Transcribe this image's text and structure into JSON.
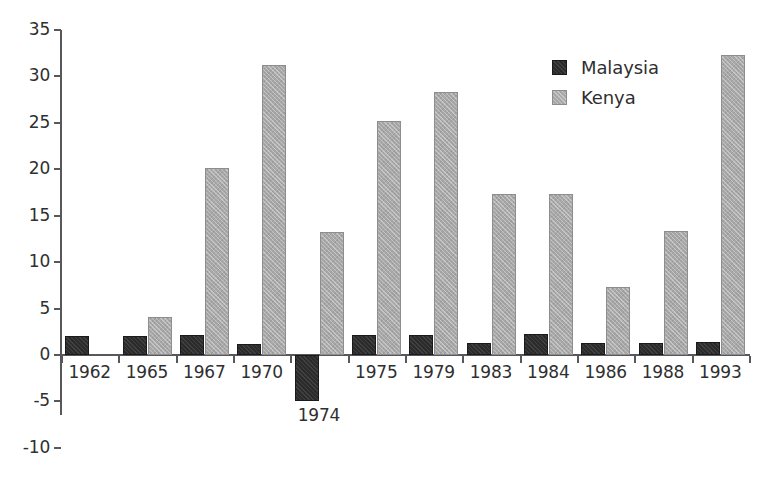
{
  "chart_data": {
    "type": "bar",
    "title": "",
    "subtitle": "",
    "xlabel": "",
    "ylabel": "",
    "categories": [
      "1962",
      "1965",
      "1967",
      "1970",
      "1974",
      "1975",
      "1979",
      "1983",
      "1984",
      "1986",
      "1988",
      "1993"
    ],
    "series": [
      {
        "name": "Malaysia",
        "color": "#2b2b2b",
        "values": [
          2.0,
          2.0,
          2.1,
          1.2,
          -5.0,
          2.2,
          2.2,
          1.3,
          2.3,
          1.3,
          1.3,
          1.4
        ]
      },
      {
        "name": "Kenya",
        "color": "#a8a8a8",
        "values": [
          null,
          4.1,
          20.1,
          31.2,
          13.2,
          25.2,
          28.3,
          17.3,
          17.3,
          7.3,
          13.3,
          32.3
        ]
      }
    ],
    "ylim": [
      -10,
      35
    ],
    "y_ticks": [
      "35",
      "30",
      "25",
      "20",
      "15",
      "10",
      "5",
      "0",
      "-5",
      "-10"
    ],
    "y_tick_values": [
      35,
      30,
      25,
      20,
      15,
      10,
      5,
      0,
      -5,
      -10
    ],
    "grid": false,
    "legend": {
      "position": "top-right",
      "entries": [
        {
          "label": "Malaysia",
          "swatch": "malaysia"
        },
        {
          "label": "Kenya",
          "swatch": "kenya"
        }
      ]
    },
    "axis_color": "#58585a",
    "text_color": "#2f2f31",
    "background": "#ffffff"
  }
}
